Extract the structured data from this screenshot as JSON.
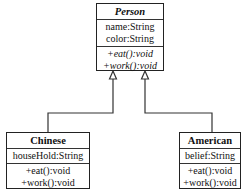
{
  "diagram": {
    "type": "UML class diagram (generalization)",
    "classes": {
      "person": {
        "name": "Person",
        "abstract": true,
        "attributes": [
          "name:String",
          "color:String"
        ],
        "operations": [
          "+eat():void",
          "+work():void"
        ]
      },
      "chinese": {
        "name": "Chinese",
        "attributes": [
          "houseHold:String"
        ],
        "operations": [
          "+eat():void",
          "+work():void"
        ]
      },
      "american": {
        "name": "American",
        "attributes": [
          "belief:String"
        ],
        "operations": [
          "+eat():void",
          "+work():void"
        ]
      }
    },
    "relations": [
      {
        "from": "Chinese",
        "to": "Person",
        "type": "inheritance"
      },
      {
        "from": "American",
        "to": "Person",
        "type": "inheritance"
      }
    ],
    "colors": {
      "line": "#222222",
      "background": "#ffffff"
    }
  }
}
